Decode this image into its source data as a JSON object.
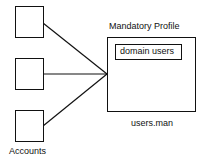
{
  "diagram": {
    "accounts_label": "Accounts",
    "account_boxes": [
      {
        "id": "account-1"
      },
      {
        "id": "account-2"
      },
      {
        "id": "account-3"
      }
    ],
    "profile": {
      "title": "Mandatory Profile",
      "inner_label": "domain users",
      "file_label": "users.man"
    },
    "colors": {
      "stroke": "#111111",
      "background": "#ffffff"
    }
  }
}
